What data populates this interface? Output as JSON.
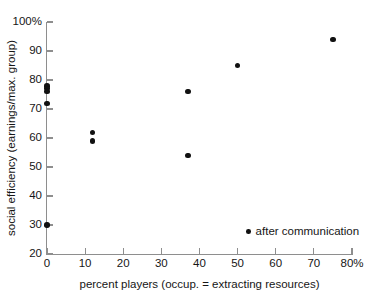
{
  "chart_data": {
    "type": "scatter",
    "title": "",
    "xlabel": "percent players (occup. = extracting resources)",
    "ylabel": "social efficiency (earnings/max. group)",
    "xlim": [
      0,
      80
    ],
    "ylim": [
      20,
      100
    ],
    "grid": false,
    "legend_position": "inside-bottom-right",
    "x_ticks": [
      0,
      10,
      20,
      30,
      40,
      50,
      60,
      70,
      80
    ],
    "x_tick_labels": [
      "0",
      "10",
      "20",
      "30",
      "40",
      "50",
      "60",
      "70",
      "80%"
    ],
    "y_ticks": [
      20,
      30,
      40,
      50,
      60,
      70,
      80,
      90,
      100
    ],
    "y_tick_labels": [
      "20",
      "30",
      "40",
      "50",
      "60",
      "70",
      "80",
      "90",
      "100%"
    ],
    "series": [
      {
        "name": "after communication",
        "marker": "filled-circle",
        "color": "#111111",
        "points": [
          {
            "x": 0,
            "y": 30
          },
          {
            "x": 0,
            "y": 72
          },
          {
            "x": 0,
            "y": 76
          },
          {
            "x": 0,
            "y": 77
          },
          {
            "x": 0,
            "y": 78
          },
          {
            "x": 12,
            "y": 59
          },
          {
            "x": 12,
            "y": 62
          },
          {
            "x": 37,
            "y": 54
          },
          {
            "x": 37,
            "y": 76
          },
          {
            "x": 50,
            "y": 85
          },
          {
            "x": 75,
            "y": 94
          }
        ]
      }
    ]
  },
  "legend": {
    "entries": [
      {
        "label": "after communication"
      }
    ]
  },
  "colors": {
    "marker": "#111111",
    "axis": "#8e8e8e",
    "text": "#161616",
    "background": "#ffffff"
  }
}
